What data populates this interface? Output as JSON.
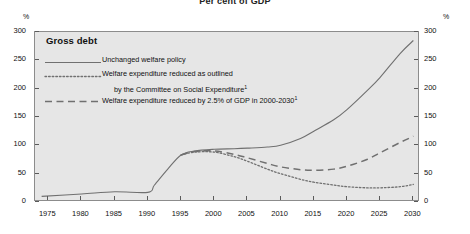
{
  "chart_data": {
    "type": "line",
    "title": "Per cent of GDP",
    "xlabel": "",
    "ylabel": "%",
    "y2label": "%",
    "xlim": [
      1973,
      2031
    ],
    "ylim": [
      0,
      300
    ],
    "ytick_values": [
      0,
      50,
      100,
      150,
      200,
      250,
      300
    ],
    "ytick_labels": [
      "0",
      "50",
      "100",
      "150",
      "200",
      "250",
      "300"
    ],
    "xtick_values": [
      1975,
      1980,
      1985,
      1990,
      1995,
      2000,
      2005,
      2010,
      2015,
      2020,
      2025,
      2030
    ],
    "xtick_labels": [
      "1975",
      "1980",
      "1985",
      "1990",
      "1995",
      "2000",
      "2005",
      "2010",
      "2015",
      "2020",
      "2025",
      "2030"
    ],
    "grid": false,
    "legend_position": "upper-left",
    "legend_title": "Gross debt",
    "plot_background": "#e6e6e6",
    "line_color": "#707070",
    "series": [
      {
        "name": "Unchanged welfare policy",
        "style": "solid",
        "x": [
          1974,
          1980,
          1985,
          1990,
          1991,
          1993,
          1995,
          1997,
          2000,
          2003,
          2005,
          2008,
          2010,
          2013,
          2015,
          2018,
          2020,
          2023,
          2025,
          2028,
          2030
        ],
        "y": [
          10,
          14,
          18,
          17,
          30,
          58,
          83,
          90,
          93,
          94,
          95,
          97,
          100,
          112,
          125,
          145,
          163,
          196,
          220,
          262,
          285
        ]
      },
      {
        "name": "Welfare expenditure reduced as outlined by the Committee on Social Expenditure",
        "style": "dotted",
        "x": [
          1995,
          1997,
          2000,
          2003,
          2005,
          2008,
          2010,
          2013,
          2015,
          2018,
          2020,
          2023,
          2025,
          2028,
          2030
        ],
        "y": [
          83,
          88,
          88,
          80,
          72,
          58,
          50,
          40,
          35,
          30,
          27,
          25,
          25,
          27,
          31
        ]
      },
      {
        "name": "Welfare expenditure reduced by 2.5% of GDP in 2000-2030",
        "style": "dashed",
        "x": [
          1995,
          1997,
          2000,
          2003,
          2005,
          2008,
          2010,
          2013,
          2015,
          2018,
          2020,
          2023,
          2025,
          2028,
          2030
        ],
        "y": [
          83,
          89,
          90,
          84,
          78,
          68,
          62,
          57,
          56,
          58,
          63,
          75,
          87,
          105,
          116
        ]
      }
    ],
    "legend_entries": [
      {
        "style": "solid",
        "label": "Unchanged welfare policy",
        "label_cont": "",
        "footnote": ""
      },
      {
        "style": "dotted",
        "label": "Welfare expenditure reduced as outlined",
        "label_cont": "by the Committee on Social Expenditure",
        "footnote": "1"
      },
      {
        "style": "dashed",
        "label": "Welfare expenditure reduced by 2.5% of GDP in 2000-2030",
        "label_cont": "",
        "footnote": "1"
      }
    ]
  }
}
